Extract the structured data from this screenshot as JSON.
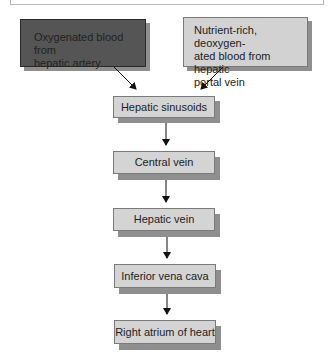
{
  "top_caption": {
    "text": ""
  },
  "sources": [
    {
      "label": "Oxygenated blood from hepatic artery",
      "lines": [
        "Oxygenated blood from",
        "hepatic artery"
      ],
      "fill": "#555555"
    },
    {
      "label": "Nutrient-rich, deoxygenated blood from hepatic portal vein",
      "lines": [
        "Nutrient-rich, deoxygen-",
        "ated blood from hepatic",
        "portal vein"
      ],
      "fill": "#d2d2d2"
    }
  ],
  "flow": [
    {
      "label": "Hepatic sinusoids"
    },
    {
      "label": "Central vein"
    },
    {
      "label": "Hepatic vein"
    },
    {
      "label": "Inferior vena cava"
    },
    {
      "label": "Right atrium of heart"
    }
  ],
  "colors": {
    "box_fill": "#d4d4d4",
    "shadow": "#8f8f8f",
    "arrow": "#111111"
  }
}
